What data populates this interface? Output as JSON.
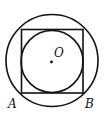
{
  "diagram": {
    "labels": {
      "center": "O",
      "bottom_left": "A",
      "bottom_right": "B"
    },
    "outer_circle": {
      "cx": 52,
      "cy": 60.5,
      "r": 46.5
    },
    "square": {
      "x": 21.5,
      "y": 29,
      "width": 61.5,
      "height": 64
    },
    "inner_circle": {
      "cx": 52,
      "cy": 61.5,
      "r": 31
    },
    "center_point": {
      "cx": 51.5,
      "cy": 62
    },
    "stroke_color": "#111111"
  }
}
